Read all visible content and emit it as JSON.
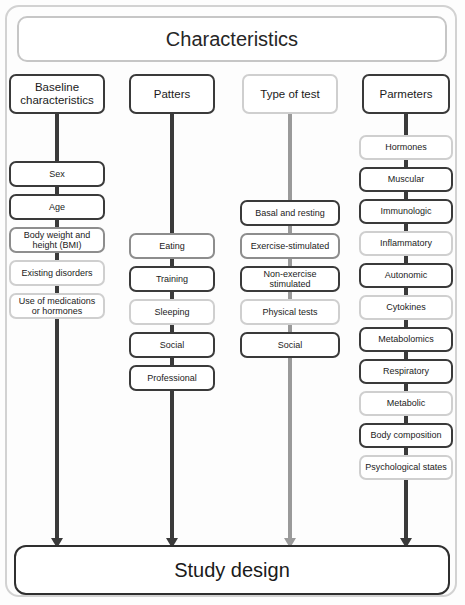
{
  "title": {
    "label": "Characteristics"
  },
  "footer": {
    "label": "Study design"
  },
  "colors": {
    "frame_border": "#d2d2d2",
    "title_border": "#c6c6c6",
    "footer_border": "#2f2f2f",
    "dark_border": "#3a3a3a",
    "mid_border": "#8d8d8d",
    "light_border": "#cfcfcf",
    "connector_dark": "#3a3a3a",
    "connector_gray": "#9a9a9a",
    "text": "#1b1b1b",
    "background": "#fdfdfd"
  },
  "columns": [
    {
      "id": "baseline",
      "header": "Baseline characteristics",
      "header_border": "dark",
      "connector_color": "#3a3a3a",
      "items": [
        {
          "label": "Sex",
          "border": "dark"
        },
        {
          "label": "Age",
          "border": "dark"
        },
        {
          "label": "Body weight and height (BMI)",
          "border": "mid"
        },
        {
          "label": "Existing disorders",
          "border": "light"
        },
        {
          "label": "Use of medications or hormones",
          "border": "light"
        }
      ]
    },
    {
      "id": "patterns",
      "header": "Patters",
      "header_border": "dark",
      "connector_color": "#3a3a3a",
      "items": [
        {
          "label": "Eating",
          "border": "mid"
        },
        {
          "label": "Training",
          "border": "dark"
        },
        {
          "label": "Sleeping",
          "border": "light"
        },
        {
          "label": "Social",
          "border": "dark"
        },
        {
          "label": "Professional",
          "border": "dark"
        }
      ]
    },
    {
      "id": "type-of-test",
      "header": "Type of test",
      "header_border": "light",
      "connector_color": "#9a9a9a",
      "items": [
        {
          "label": "Basal and resting",
          "border": "dark"
        },
        {
          "label": "Exercise-stimulated",
          "border": "mid"
        },
        {
          "label": "Non-exercise stimulated",
          "border": "dark"
        },
        {
          "label": "Physical tests",
          "border": "light"
        },
        {
          "label": "Social",
          "border": "dark"
        }
      ]
    },
    {
      "id": "parameters",
      "header": "Parmeters",
      "header_border": "dark",
      "connector_color": "#3a3a3a",
      "items": [
        {
          "label": "Hormones",
          "border": "light"
        },
        {
          "label": "Muscular",
          "border": "dark"
        },
        {
          "label": "Immunologic",
          "border": "dark"
        },
        {
          "label": "Inflammatory",
          "border": "light"
        },
        {
          "label": "Autonomic",
          "border": "dark"
        },
        {
          "label": "Cytokines",
          "border": "light"
        },
        {
          "label": "Metabolomics",
          "border": "dark"
        },
        {
          "label": "Respiratory",
          "border": "dark"
        },
        {
          "label": "Metabolic",
          "border": "light"
        },
        {
          "label": "Body composition",
          "border": "dark"
        },
        {
          "label": "Psychological states",
          "border": "light"
        }
      ]
    }
  ],
  "chart_data": {
    "type": "diagram",
    "title": "Characteristics",
    "terminal": "Study design",
    "structure": "four parallel vertical chains branching from a single top header into a single bottom terminal",
    "branches": 4,
    "branch_names": [
      "Baseline characteristics",
      "Patters",
      "Type of test",
      "Parmeters"
    ],
    "branch_item_counts": [
      5,
      5,
      5,
      11
    ]
  }
}
